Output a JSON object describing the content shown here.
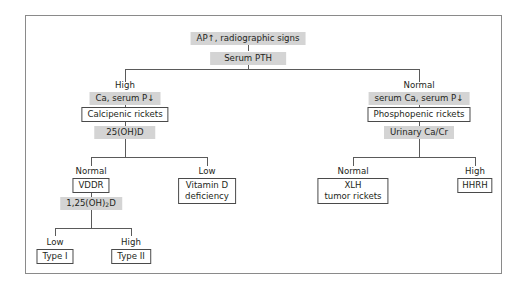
{
  "diagram": {
    "root": "AP↑, radiographic signs",
    "test1": "Serum PTH",
    "left": {
      "branch_label": "High",
      "finding": "Ca, serum P↓",
      "category": "Calcipenic rickets",
      "test": "25(OH)D",
      "normal": {
        "branch_label": "Normal",
        "diagnosis": "VDDR",
        "test_prefix": "1,25(OH)",
        "test_sub": "2",
        "test_suffix": "D",
        "low": {
          "branch_label": "Low",
          "diagnosis": "Type I"
        },
        "high": {
          "branch_label": "High",
          "diagnosis": "Type II"
        }
      },
      "low": {
        "branch_label": "Low",
        "diagnosis_line1": "Vitamin D",
        "diagnosis_line2": "deficiency"
      }
    },
    "right": {
      "branch_label": "Normal",
      "finding": "serum Ca, serum P↓",
      "category": "Phosphopenic rickets",
      "test": "Urinary Ca/Cr",
      "normal": {
        "branch_label": "Normal",
        "diagnosis_line1": "XLH",
        "diagnosis_line2": "tumor rickets"
      },
      "high": {
        "branch_label": "High",
        "diagnosis": "HHRH"
      }
    }
  }
}
